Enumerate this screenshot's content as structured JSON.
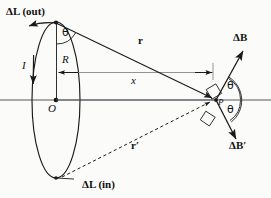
{
  "figure": {
    "type": "physics-vector-diagram",
    "background_color": "#fbfbfa",
    "stroke_color": "#1a1a1a"
  },
  "labels": {
    "delta_l_out": "ΔL (out)",
    "delta_l_in": "ΔL (in)",
    "current": "I",
    "radius": "R",
    "center": "O",
    "distance_r": "r",
    "distance_r_prime": "r′",
    "axis_x": "x",
    "theta_top": "θ",
    "theta_upper_right": "θ",
    "theta_lower_right": "θ",
    "point_p": "P",
    "delta_b": "ΔB",
    "delta_b_prime": "ΔB′"
  },
  "geometry": {
    "loop": {
      "center_x": 56,
      "center_y": 100,
      "radius_x": 24,
      "radius_y": 78
    },
    "top_element": {
      "x": 56,
      "y": 22
    },
    "bottom_element": {
      "x": 56,
      "y": 178
    },
    "center_o": {
      "x": 56,
      "y": 100
    },
    "point_p": {
      "x": 216,
      "y": 100
    },
    "axis_line": {
      "x1": 0,
      "y1": 100,
      "x2": 271,
      "y2": 100
    },
    "r_vector": {
      "from": [
        56,
        22
      ],
      "to": [
        216,
        100
      ]
    },
    "r_prime_vector": {
      "from": [
        56,
        178
      ],
      "to": [
        216,
        100
      ]
    },
    "delta_b_vector": {
      "from": [
        216,
        100
      ],
      "to": [
        244,
        52
      ]
    },
    "delta_b_prime_vector": {
      "from": [
        216,
        100
      ],
      "to": [
        238,
        140
      ]
    }
  },
  "label_positions": {
    "delta_l_out": {
      "x": 6,
      "y": 6
    },
    "delta_l_in": {
      "x": 82,
      "y": 180
    },
    "current": {
      "x": 22,
      "y": 60
    },
    "radius": {
      "x": 62,
      "y": 56
    },
    "center": {
      "x": 48,
      "y": 104
    },
    "distance_r": {
      "x": 138,
      "y": 40
    },
    "distance_r_prime": {
      "x": 131,
      "y": 141
    },
    "axis_x": {
      "x": 131,
      "y": 76
    },
    "theta_top": {
      "x": 62,
      "y": 29
    },
    "theta_upper_right": {
      "x": 227,
      "y": 81
    },
    "theta_lower_right": {
      "x": 227,
      "y": 103
    },
    "point_p": {
      "x": 218,
      "y": 101
    },
    "delta_b": {
      "x": 232,
      "y": 32
    },
    "delta_b_prime": {
      "x": 228,
      "y": 140
    }
  }
}
